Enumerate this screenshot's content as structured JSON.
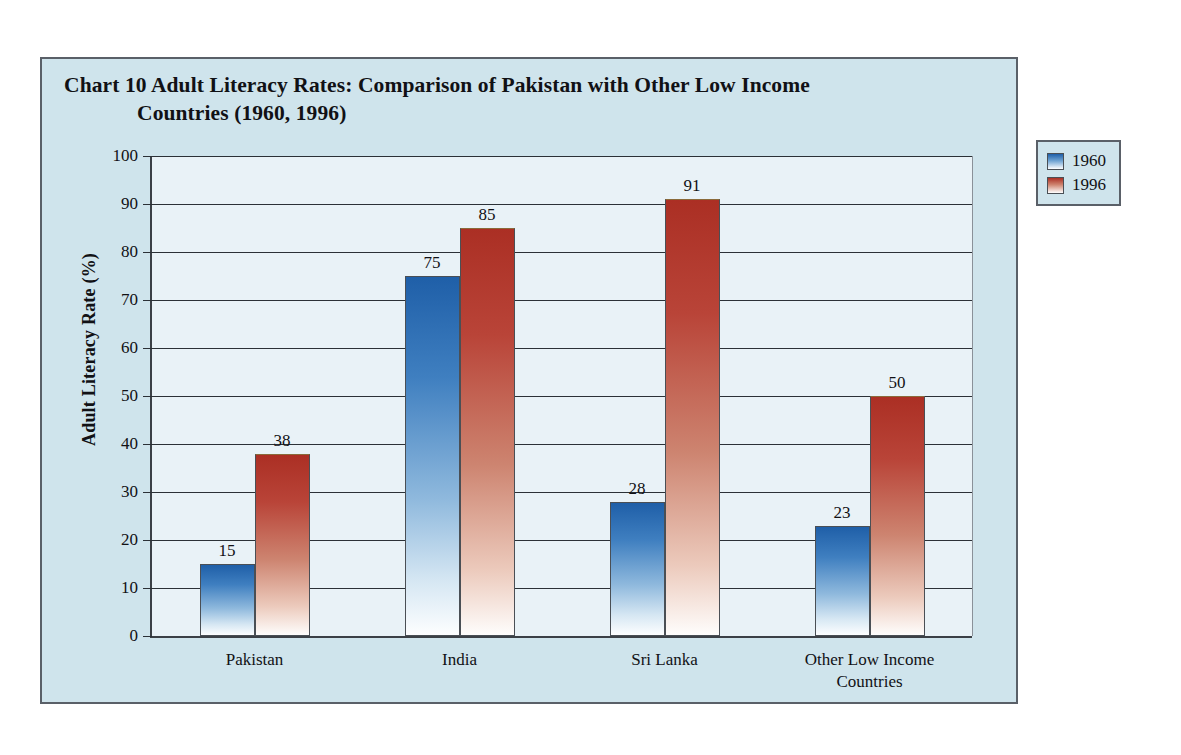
{
  "chart_data": {
    "type": "bar",
    "title": "Chart 10  Adult Literacy Rates: Comparison of Pakistan with Other Low Income Countries (1960, 1996)",
    "title_line1": "Chart 10  Adult Literacy Rates: Comparison of Pakistan with Other Low Income",
    "title_line2": "Countries (1960, 1996)",
    "xlabel": "",
    "ylabel": "Adult Literacy Rate (%)",
    "ylim": [
      0,
      100
    ],
    "ytick_step": 10,
    "ytick_labels": [
      "100",
      "90",
      "80",
      "70",
      "60",
      "50",
      "40",
      "30",
      "20",
      "10",
      "0"
    ],
    "grid": true,
    "legend_position": "right-outside",
    "categories": [
      "Pakistan",
      "India",
      "Sri Lanka",
      "Other Low Income Countries"
    ],
    "category_lines": [
      [
        "Pakistan"
      ],
      [
        "India"
      ],
      [
        "Sri Lanka"
      ],
      [
        "Other Low Income",
        "Countries"
      ]
    ],
    "series": [
      {
        "name": "1960",
        "color": "#1f5fa8",
        "values": [
          15,
          75,
          28,
          23
        ]
      },
      {
        "name": "1996",
        "color": "#ab2f24",
        "values": [
          38,
          85,
          91,
          50
        ]
      }
    ],
    "data_labels": [
      {
        "series": "1960",
        "category": "Pakistan",
        "value": "15"
      },
      {
        "series": "1996",
        "category": "Pakistan",
        "value": "38"
      },
      {
        "series": "1960",
        "category": "India",
        "value": "75"
      },
      {
        "series": "1996",
        "category": "India",
        "value": "85"
      },
      {
        "series": "1960",
        "category": "Sri Lanka",
        "value": "28"
      },
      {
        "series": "1996",
        "category": "Sri Lanka",
        "value": "91"
      },
      {
        "series": "1960",
        "category": "Other Low Income Countries",
        "value": "23"
      },
      {
        "series": "1996",
        "category": "Other Low Income Countries",
        "value": "50"
      }
    ]
  },
  "legend": {
    "items": [
      {
        "label": "1960"
      },
      {
        "label": "1996"
      }
    ]
  },
  "colors": {
    "page_background": "#ffffff",
    "frame_background": "#cfe4ec",
    "plot_background": "#e9f2f7",
    "axis": "#2b3137",
    "series_1960": "#1f5fa8",
    "series_1996": "#ab2f24",
    "text": "#111115"
  }
}
